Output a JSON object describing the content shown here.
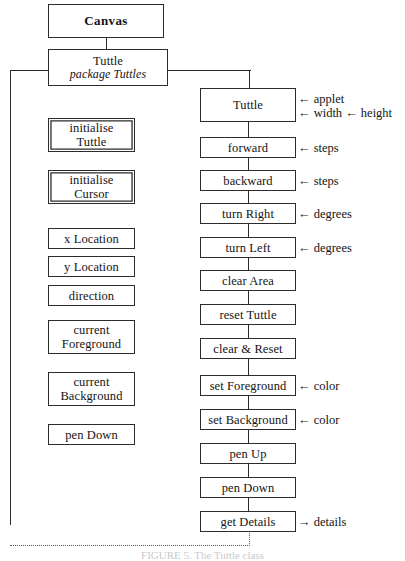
{
  "diagram": {
    "caption": "FIGURE 5. The Tuttle class",
    "colors": {
      "line": "#2b2b2b",
      "dotted": "#5a5a5a",
      "background": "#ffffff"
    }
  },
  "header": {
    "canvas": {
      "label": "Canvas"
    },
    "tuttle_class": {
      "label": "Tuttle",
      "package": "package Tuttles"
    }
  },
  "attributes": [
    {
      "label": "initialise Tuttle",
      "line1": "initialise",
      "line2": "Tuttle",
      "double": true
    },
    {
      "label": "initialise Cursor",
      "line1": "initialise",
      "line2": "Cursor",
      "double": true
    },
    {
      "label": "x Location",
      "line1": "x Location",
      "line2": "",
      "double": false
    },
    {
      "label": "y Location",
      "line1": "y Location",
      "line2": "",
      "double": false
    },
    {
      "label": "direction",
      "line1": "direction",
      "line2": "",
      "double": false
    },
    {
      "label": "current Foreground",
      "line1": "current",
      "line2": "Foreground",
      "double": false
    },
    {
      "label": "current Background",
      "line1": "current",
      "line2": "Background",
      "double": false
    },
    {
      "label": "pen Down",
      "line1": "pen Down",
      "line2": "",
      "double": false
    }
  ],
  "methods": [
    {
      "label": "Tuttle",
      "params": [
        "← applet",
        "← width ← height"
      ],
      "tall": true,
      "out": false
    },
    {
      "label": "forward",
      "params": [
        "← steps"
      ],
      "tall": false,
      "out": false
    },
    {
      "label": "backward",
      "params": [
        "← steps"
      ],
      "tall": false,
      "out": false
    },
    {
      "label": "turn Right",
      "params": [
        "← degrees"
      ],
      "tall": false,
      "out": false
    },
    {
      "label": "turn Left",
      "params": [
        "← degrees"
      ],
      "tall": false,
      "out": false
    },
    {
      "label": "clear Area",
      "params": [],
      "tall": false,
      "out": false
    },
    {
      "label": "reset Tuttle",
      "params": [],
      "tall": false,
      "out": false
    },
    {
      "label": "clear & Reset",
      "params": [],
      "tall": false,
      "out": false
    },
    {
      "label": "set Foreground",
      "params": [
        "← color"
      ],
      "tall": false,
      "out": false
    },
    {
      "label": "set Background",
      "params": [
        "← color"
      ],
      "tall": false,
      "out": false
    },
    {
      "label": "pen Up",
      "params": [],
      "tall": false,
      "out": false
    },
    {
      "label": "pen Down",
      "params": [],
      "tall": false,
      "out": false
    },
    {
      "label": "get Details",
      "params": [
        "→ details"
      ],
      "tall": false,
      "out": true
    }
  ]
}
